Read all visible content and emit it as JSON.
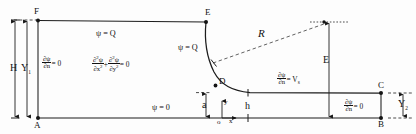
{
  "figure": {
    "type": "engineering-boundary-value-diagram"
  },
  "points": {
    "A": "A",
    "B": "B",
    "C": "C",
    "D": "D",
    "E_top": "E",
    "F": "F"
  },
  "dimensions": {
    "H": "H",
    "Y1_base": "Y",
    "Y1_sub": "1",
    "Y2_base": "Y",
    "Y2_sub": "2",
    "E": "E",
    "a": "a",
    "h": "h",
    "R": "R"
  },
  "axes": {
    "origin": "o",
    "x": "x",
    "y": "y"
  },
  "boundary_conditions": {
    "top_stream": "ψ = Q",
    "inlet_stream": "ψ = Q",
    "bottom_stream": "ψ = 0",
    "left_wall_num": "∂ψ",
    "left_wall_den": "∂n",
    "left_wall_rhs": "= 0",
    "right_wall_num": "∂ψ",
    "right_wall_den": "∂n",
    "right_wall_rhs": "= 0",
    "free_surface_num": "∂ψ",
    "free_surface_den": "∂n",
    "free_surface_rhs": "= V",
    "free_surface_sub": "s"
  },
  "governing_equation": {
    "term1_num": "∂",
    "term1_num_sup": "2",
    "term1_num_var": "ψ",
    "term1_den": "∂x",
    "term1_den_sup": "2",
    "plus": "+",
    "term2_num": "∂",
    "term2_num_sup": "2",
    "term2_num_var": "ψ",
    "term2_den": "∂y",
    "term2_den_sup": "2",
    "rhs": "= 0"
  },
  "colors": {
    "ink": "#1d1d1d",
    "background": "#fdfdfd",
    "dashed": "#2a2a2a"
  }
}
